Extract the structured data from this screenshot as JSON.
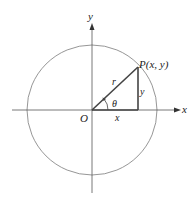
{
  "diagram": {
    "axes": {
      "x_label": "x",
      "y_label": "y"
    },
    "origin_label": "O",
    "point_label": "P(x,  y)",
    "radius_label": "r",
    "angle_label": "θ",
    "horizontal_leg_label": "x",
    "vertical_leg_label": "y",
    "colors": {
      "circle": "#888888",
      "axes": "#444444",
      "triangle": "#333333",
      "text": "#222222"
    }
  }
}
